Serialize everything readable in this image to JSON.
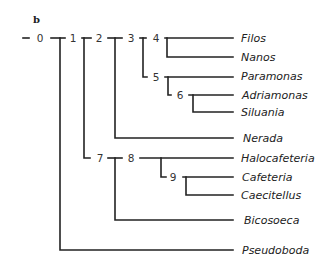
{
  "figure": {
    "panel_label": "b",
    "line_color": "#222222",
    "nodes": [
      {
        "id": "0",
        "x": 40,
        "y": 38
      },
      {
        "id": "1",
        "x": 73,
        "y": 38
      },
      {
        "id": "2",
        "x": 99,
        "y": 38
      },
      {
        "id": "3",
        "x": 131,
        "y": 38
      },
      {
        "id": "4",
        "x": 156,
        "y": 38
      },
      {
        "id": "5",
        "x": 156,
        "y": 77
      },
      {
        "id": "6",
        "x": 180,
        "y": 95
      },
      {
        "id": "7",
        "x": 100,
        "y": 158
      },
      {
        "id": "8",
        "x": 131,
        "y": 158
      },
      {
        "id": "9",
        "x": 173,
        "y": 177
      }
    ],
    "taxa": [
      {
        "name": "Filos",
        "y": 38
      },
      {
        "name": "Nanos",
        "y": 57
      },
      {
        "name": "Paramonas",
        "y": 76
      },
      {
        "name": "Adriamonas",
        "y": 95
      },
      {
        "name": "Siluania",
        "y": 112
      },
      {
        "name": "Nerada",
        "y": 138
      },
      {
        "name": "Halocafeteria",
        "y": 158
      },
      {
        "name": "Cafeteria",
        "y": 177
      },
      {
        "name": "Caecitellus",
        "y": 195
      },
      {
        "name": "Bicosoeca",
        "y": 220
      },
      {
        "name": "Pseudoboda",
        "y": 250
      }
    ]
  }
}
